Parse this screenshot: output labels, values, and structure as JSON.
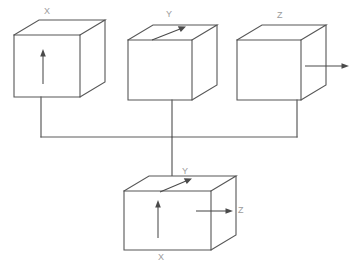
{
  "diagram": {
    "background_color": "#ffffff",
    "line_color": "#575757",
    "label_color": "#9b9b9b",
    "arrow_color": "#4a4a4a",
    "cubes": [
      {
        "id": "cube-x",
        "label": "X",
        "label_position": "top",
        "arrow": "vertical-up-on-front-face",
        "description": "Cube with upward arrow on front face labeled X"
      },
      {
        "id": "cube-y",
        "label": "Y",
        "label_position": "top",
        "arrow": "diagonal-up-right-on-top-face",
        "description": "Cube with diagonal arrow on top face labeled Y"
      },
      {
        "id": "cube-z",
        "label": "Z",
        "label_position": "top",
        "arrow": "horizontal-right-on-side-face",
        "description": "Cube with rightward arrow on right face labeled Z"
      },
      {
        "id": "cube-xyz",
        "label_top": "Y",
        "label_right": "Z",
        "label_bottom": "X",
        "arrows": [
          "vertical-up-on-front-face",
          "diagonal-up-right-on-top-face",
          "horizontal-right-on-side-face"
        ],
        "description": "Combined cube showing all three axes X, Y and Z"
      }
    ],
    "connector": {
      "type": "bus-junction",
      "description": "Three vertical drop lines from the top cubes joined by a horizontal bar, with a centre line continuing down to the combined cube"
    },
    "labels": {
      "cube1_top": "X",
      "cube2_top": "Y",
      "cube3_top": "Z",
      "cube4_top": "Y",
      "cube4_right": "Z",
      "cube4_bottom": "X"
    }
  }
}
